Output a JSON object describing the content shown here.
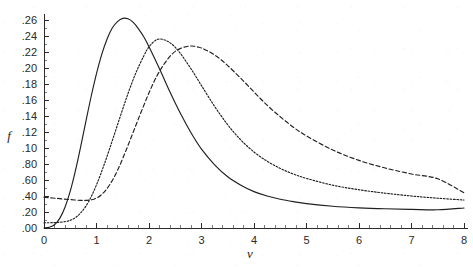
{
  "chart_data": {
    "type": "line",
    "title": "",
    "subtitle": "",
    "xlabel": "v",
    "ylabel": "f",
    "xlim": [
      0,
      8
    ],
    "ylim": [
      0,
      0.268
    ],
    "grid": false,
    "legend": "none",
    "x_ticks": [
      {
        "value": 0,
        "label": "0"
      },
      {
        "value": 1,
        "label": "1"
      },
      {
        "value": 2,
        "label": "2"
      },
      {
        "value": 3,
        "label": "3"
      },
      {
        "value": 4,
        "label": "4"
      },
      {
        "value": 5,
        "label": "5"
      },
      {
        "value": 6,
        "label": "6"
      },
      {
        "value": 7,
        "label": "7"
      },
      {
        "value": 8,
        "label": "8"
      }
    ],
    "x_minor_per_major": 5,
    "y_ticks": [
      {
        "value": 0.26,
        "label": ".26"
      },
      {
        "value": 0.24,
        "label": ".24"
      },
      {
        "value": 0.22,
        "label": ".22"
      },
      {
        "value": 0.2,
        "label": ".20"
      },
      {
        "value": 0.18,
        "label": ".18"
      },
      {
        "value": 0.16,
        "label": ".16"
      },
      {
        "value": 0.14,
        "label": ".14"
      },
      {
        "value": 0.12,
        "label": ".12"
      },
      {
        "value": 0.1,
        "label": ".10"
      },
      {
        "value": 0.08,
        "label": ".80"
      },
      {
        "value": 0.06,
        "label": ".60"
      },
      {
        "value": 0.04,
        "label": ".40"
      },
      {
        "value": 0.02,
        "label": ".20"
      },
      {
        "value": 0.0,
        "label": ".00"
      }
    ],
    "y_minor_per_major": 2,
    "series": [
      {
        "name": "curve-1",
        "style": "solid",
        "peak": {
          "x": 1.5,
          "y": 0.262
        },
        "points": [
          [
            0.0,
            0.0
          ],
          [
            0.1,
            0.001
          ],
          [
            0.2,
            0.004
          ],
          [
            0.3,
            0.012
          ],
          [
            0.4,
            0.026
          ],
          [
            0.5,
            0.046
          ],
          [
            0.6,
            0.072
          ],
          [
            0.7,
            0.102
          ],
          [
            0.8,
            0.134
          ],
          [
            0.9,
            0.165
          ],
          [
            1.0,
            0.193
          ],
          [
            1.1,
            0.217
          ],
          [
            1.2,
            0.236
          ],
          [
            1.3,
            0.25
          ],
          [
            1.4,
            0.258
          ],
          [
            1.5,
            0.262
          ],
          [
            1.6,
            0.2615
          ],
          [
            1.7,
            0.257
          ],
          [
            1.8,
            0.249
          ],
          [
            1.9,
            0.239
          ],
          [
            2.0,
            0.2265
          ],
          [
            2.2,
            0.199
          ],
          [
            2.4,
            0.17
          ],
          [
            2.6,
            0.143
          ],
          [
            2.8,
            0.119
          ],
          [
            3.0,
            0.0985
          ],
          [
            3.25,
            0.079
          ],
          [
            3.5,
            0.064
          ],
          [
            3.75,
            0.0535
          ],
          [
            4.0,
            0.0455
          ],
          [
            4.25,
            0.04
          ],
          [
            4.5,
            0.036
          ],
          [
            4.75,
            0.033
          ],
          [
            5.0,
            0.0305
          ],
          [
            5.5,
            0.0272
          ],
          [
            6.0,
            0.0252
          ],
          [
            6.5,
            0.024
          ],
          [
            7.0,
            0.0233
          ],
          [
            7.5,
            0.0228
          ],
          [
            8.0,
            0.025
          ]
        ]
      },
      {
        "name": "curve-2",
        "style": "dotted",
        "peak": {
          "x": 2.15,
          "y": 0.2355
        },
        "points": [
          [
            0.0,
            0.0065
          ],
          [
            0.2,
            0.0068
          ],
          [
            0.4,
            0.008
          ],
          [
            0.55,
            0.011
          ],
          [
            0.7,
            0.019
          ],
          [
            0.85,
            0.033
          ],
          [
            1.0,
            0.054
          ],
          [
            1.15,
            0.08
          ],
          [
            1.3,
            0.109
          ],
          [
            1.45,
            0.139
          ],
          [
            1.6,
            0.168
          ],
          [
            1.75,
            0.194
          ],
          [
            1.9,
            0.215
          ],
          [
            2.0,
            0.2265
          ],
          [
            2.15,
            0.2355
          ],
          [
            2.3,
            0.235
          ],
          [
            2.45,
            0.229
          ],
          [
            2.6,
            0.218
          ],
          [
            2.8,
            0.199
          ],
          [
            3.0,
            0.178
          ],
          [
            3.25,
            0.152
          ],
          [
            3.5,
            0.129
          ],
          [
            3.75,
            0.11
          ],
          [
            4.0,
            0.095
          ],
          [
            4.25,
            0.0835
          ],
          [
            4.5,
            0.0745
          ],
          [
            4.75,
            0.0675
          ],
          [
            5.0,
            0.062
          ],
          [
            5.5,
            0.0535
          ],
          [
            6.0,
            0.0478
          ],
          [
            6.5,
            0.0435
          ],
          [
            7.0,
            0.04
          ],
          [
            7.5,
            0.0372
          ],
          [
            8.0,
            0.035
          ]
        ]
      },
      {
        "name": "curve-3",
        "style": "dashed",
        "peak": {
          "x": 2.78,
          "y": 0.2275
        },
        "points": [
          [
            0.0,
            0.0385
          ],
          [
            0.25,
            0.037
          ],
          [
            0.5,
            0.0355
          ],
          [
            0.75,
            0.0345
          ],
          [
            0.95,
            0.036
          ],
          [
            1.1,
            0.042
          ],
          [
            1.25,
            0.054
          ],
          [
            1.4,
            0.072
          ],
          [
            1.55,
            0.095
          ],
          [
            1.7,
            0.12
          ],
          [
            1.85,
            0.145
          ],
          [
            2.0,
            0.169
          ],
          [
            2.15,
            0.19
          ],
          [
            2.3,
            0.206
          ],
          [
            2.45,
            0.218
          ],
          [
            2.6,
            0.2245
          ],
          [
            2.78,
            0.2275
          ],
          [
            2.95,
            0.226
          ],
          [
            3.1,
            0.222
          ],
          [
            3.3,
            0.214
          ],
          [
            3.5,
            0.203
          ],
          [
            3.75,
            0.187
          ],
          [
            4.0,
            0.17
          ],
          [
            4.25,
            0.1535
          ],
          [
            4.5,
            0.139
          ],
          [
            4.75,
            0.126
          ],
          [
            5.0,
            0.115
          ],
          [
            5.5,
            0.0975
          ],
          [
            6.0,
            0.0845
          ],
          [
            6.5,
            0.075
          ],
          [
            7.0,
            0.0675
          ],
          [
            7.5,
            0.0615
          ],
          [
            8.0,
            0.044
          ]
        ]
      }
    ]
  },
  "plot_geometry": {
    "origin_x": 44,
    "origin_y": 228,
    "x_scale_px_per_unit": 52.5,
    "y_scale_px_per_unit": 800,
    "axis_top_y": 14,
    "axis_right_x": 468
  }
}
